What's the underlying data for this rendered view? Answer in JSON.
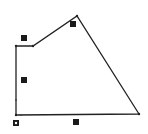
{
  "diagram": {
    "type": "polygon",
    "stroke_color": "#222222",
    "label_color": "#1a1a1a",
    "vertices": [
      {
        "x": 16,
        "y": 46
      },
      {
        "x": 33,
        "y": 46
      },
      {
        "x": 77,
        "y": 16
      },
      {
        "x": 139,
        "y": 114
      },
      {
        "x": 16,
        "y": 115
      }
    ],
    "edge_labels": [
      {
        "x": 24,
        "y": 38
      },
      {
        "x": 73,
        "y": 24
      },
      {
        "x": 24,
        "y": 80
      },
      {
        "x": 76,
        "y": 122
      }
    ],
    "origin_marker": {
      "x": 16,
      "y": 123
    }
  }
}
